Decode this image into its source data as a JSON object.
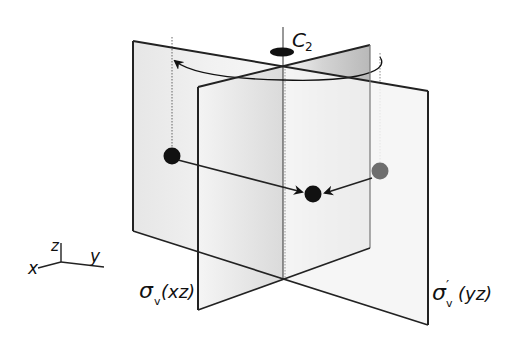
{
  "diagram": {
    "axis_label": "C",
    "axis_subscript": "2",
    "plane_left_label": {
      "sigma": "σ",
      "subscript": "v",
      "prime": "",
      "paren": "(xz)"
    },
    "plane_right_label": {
      "sigma": "σ",
      "subscript": "v",
      "prime": "′",
      "paren": "(yz)"
    },
    "coordinate_axes": {
      "x": "x",
      "y": "y",
      "z": "z"
    },
    "colors": {
      "plane_fill_light": "#ececec",
      "plane_fill_dark": "#bdbdbd",
      "edge": "#222222",
      "atom_black": "#111111",
      "atom_gray": "#6e6e6e"
    }
  }
}
